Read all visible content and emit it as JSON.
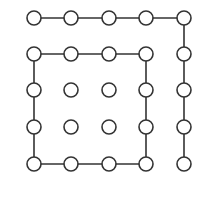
{
  "diagram": {
    "title": "",
    "style": {
      "stroke": "#333333",
      "fill": "#ffffff",
      "node_radius": 7,
      "stroke_width": 1.6
    },
    "columns_x": [
      34,
      71,
      109,
      146,
      184
    ],
    "rows_y": [
      18,
      54,
      90,
      127,
      164
    ],
    "nodes": [
      {
        "id": "r0c0",
        "row": 0,
        "col": 0
      },
      {
        "id": "r0c1",
        "row": 0,
        "col": 1
      },
      {
        "id": "r0c2",
        "row": 0,
        "col": 2
      },
      {
        "id": "r0c3",
        "row": 0,
        "col": 3
      },
      {
        "id": "r0c4",
        "row": 0,
        "col": 4
      },
      {
        "id": "r1c0",
        "row": 1,
        "col": 0
      },
      {
        "id": "r1c1",
        "row": 1,
        "col": 1
      },
      {
        "id": "r1c2",
        "row": 1,
        "col": 2
      },
      {
        "id": "r1c3",
        "row": 1,
        "col": 3
      },
      {
        "id": "r1c4",
        "row": 1,
        "col": 4
      },
      {
        "id": "r2c0",
        "row": 2,
        "col": 0
      },
      {
        "id": "r2c1",
        "row": 2,
        "col": 1
      },
      {
        "id": "r2c2",
        "row": 2,
        "col": 2
      },
      {
        "id": "r2c3",
        "row": 2,
        "col": 3
      },
      {
        "id": "r2c4",
        "row": 2,
        "col": 4
      },
      {
        "id": "r3c0",
        "row": 3,
        "col": 0
      },
      {
        "id": "r3c1",
        "row": 3,
        "col": 1
      },
      {
        "id": "r3c2",
        "row": 3,
        "col": 2
      },
      {
        "id": "r3c3",
        "row": 3,
        "col": 3
      },
      {
        "id": "r3c4",
        "row": 3,
        "col": 4
      },
      {
        "id": "r4c0",
        "row": 4,
        "col": 0
      },
      {
        "id": "r4c1",
        "row": 4,
        "col": 1
      },
      {
        "id": "r4c2",
        "row": 4,
        "col": 2
      },
      {
        "id": "r4c3",
        "row": 4,
        "col": 3
      },
      {
        "id": "r4c4",
        "row": 4,
        "col": 4
      }
    ],
    "edges": [
      [
        "r0c0",
        "r0c1"
      ],
      [
        "r0c1",
        "r0c2"
      ],
      [
        "r0c2",
        "r0c3"
      ],
      [
        "r0c3",
        "r0c4"
      ],
      [
        "r0c4",
        "r1c4"
      ],
      [
        "r1c4",
        "r2c4"
      ],
      [
        "r2c4",
        "r3c4"
      ],
      [
        "r3c4",
        "r4c4"
      ],
      [
        "r1c0",
        "r1c1"
      ],
      [
        "r1c1",
        "r1c2"
      ],
      [
        "r1c2",
        "r1c3"
      ],
      [
        "r1c0",
        "r2c0"
      ],
      [
        "r2c0",
        "r3c0"
      ],
      [
        "r3c0",
        "r4c0"
      ],
      [
        "r1c3",
        "r2c3"
      ],
      [
        "r2c3",
        "r3c3"
      ],
      [
        "r3c3",
        "r4c3"
      ],
      [
        "r4c0",
        "r4c1"
      ],
      [
        "r4c1",
        "r4c2"
      ],
      [
        "r4c2",
        "r4c3"
      ]
    ]
  }
}
